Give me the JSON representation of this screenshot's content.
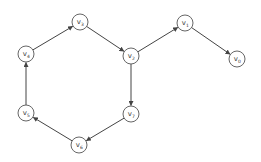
{
  "diagram": {
    "type": "directed-graph",
    "node_radius": 8,
    "colors": {
      "node_stroke": "#555555",
      "edge": "#444444",
      "label": "#333333",
      "background": "#ffffff"
    },
    "nodes": [
      {
        "id": "v0",
        "base": "v",
        "sub": "0",
        "x": 237,
        "y": 59
      },
      {
        "id": "v1",
        "base": "v",
        "sub": "1",
        "x": 185,
        "y": 23
      },
      {
        "id": "v2",
        "base": "v",
        "sub": "2",
        "x": 131,
        "y": 56
      },
      {
        "id": "v3",
        "base": "v",
        "sub": "3",
        "x": 80,
        "y": 22
      },
      {
        "id": "v4",
        "base": "v",
        "sub": "4",
        "x": 26,
        "y": 54
      },
      {
        "id": "v5",
        "base": "v",
        "sub": "5",
        "x": 26,
        "y": 113
      },
      {
        "id": "v6",
        "base": "v",
        "sub": "6",
        "x": 79,
        "y": 145
      },
      {
        "id": "v7",
        "base": "v",
        "sub": "7",
        "x": 131,
        "y": 114
      }
    ],
    "edges": [
      {
        "from": "v4",
        "to": "v3"
      },
      {
        "from": "v3",
        "to": "v2"
      },
      {
        "from": "v2",
        "to": "v1"
      },
      {
        "from": "v1",
        "to": "v0"
      },
      {
        "from": "v2",
        "to": "v7"
      },
      {
        "from": "v7",
        "to": "v6"
      },
      {
        "from": "v6",
        "to": "v5"
      },
      {
        "from": "v5",
        "to": "v4"
      }
    ]
  }
}
